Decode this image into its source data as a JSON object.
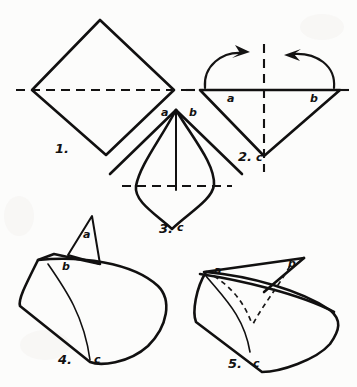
{
  "page": {
    "background_color": "#fcfcfb",
    "ink_color": "#121111",
    "width": 357,
    "height": 387,
    "media": "hand-drawn pencil origami instruction sheet"
  },
  "steps": [
    {
      "number": "1.",
      "number_x": 55,
      "number_y": 142,
      "caption": "square sheet set as a diamond with horizontal fold crease",
      "labels": []
    },
    {
      "number": "2.",
      "number_x": 238,
      "number_y": 150,
      "caption": "lower triangle with vertical crease and two folding arrows",
      "labels": [
        {
          "text": "a",
          "x": 227,
          "y": 93
        },
        {
          "text": "b",
          "x": 310,
          "y": 93
        },
        {
          "text": "c",
          "x": 256,
          "y": 152
        }
      ]
    },
    {
      "number": "3.",
      "number_x": 159,
      "number_y": 222,
      "caption": "kite form with centre line and horizontal crease",
      "labels": [
        {
          "text": "a",
          "x": 161,
          "y": 107
        },
        {
          "text": "b",
          "x": 189,
          "y": 107
        },
        {
          "text": "c",
          "x": 177,
          "y": 222
        }
      ]
    },
    {
      "number": "4.",
      "number_x": 58,
      "number_y": 353,
      "caption": "curved body with flap a raised, corner b at left, point c at base",
      "labels": [
        {
          "text": "a",
          "x": 83,
          "y": 229
        },
        {
          "text": "b",
          "x": 62,
          "y": 261
        },
        {
          "text": "c",
          "x": 94,
          "y": 354
        }
      ]
    },
    {
      "number": "5.",
      "number_x": 228,
      "number_y": 357,
      "caption": "finished form with point b swung right, dashed creases showing",
      "labels": [
        {
          "text": "a",
          "x": 214,
          "y": 265
        },
        {
          "text": "b",
          "x": 288,
          "y": 258
        },
        {
          "text": "c",
          "x": 253,
          "y": 358
        }
      ]
    }
  ],
  "annotations": {
    "arrow_left": "curved arrow folding left corner up to centre",
    "arrow_right": "curved arrow folding right corner up to centre"
  }
}
